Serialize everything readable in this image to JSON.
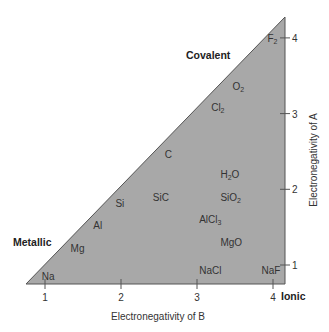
{
  "chart_data": {
    "type": "scatter",
    "title": "",
    "xlabel": "Electronegativity of B",
    "ylabel": "Electronegativity of A",
    "xlim": [
      0.75,
      4.15
    ],
    "ylim": [
      0.75,
      4.3
    ],
    "x_ticks": [
      "1",
      "2",
      "3",
      "4"
    ],
    "y_ticks": [
      "1",
      "2",
      "3",
      "4"
    ],
    "region_labels": {
      "covalent": "Covalent",
      "metallic": "Metallic",
      "ionic": "Ionic"
    },
    "fill_color": "#a8a8a8",
    "points": [
      {
        "label": "Na",
        "base": "Na",
        "sub": "",
        "x": 0.93,
        "y": 0.93
      },
      {
        "label": "Mg",
        "base": "Mg",
        "sub": "",
        "x": 1.31,
        "y": 1.31
      },
      {
        "label": "Al",
        "base": "Al",
        "sub": "",
        "x": 1.61,
        "y": 1.61
      },
      {
        "label": "Si",
        "base": "Si",
        "sub": "",
        "x": 1.9,
        "y": 1.9
      },
      {
        "label": "C",
        "base": "C",
        "sub": "",
        "x": 2.55,
        "y": 2.55
      },
      {
        "label": "Cl2",
        "base": "Cl",
        "sub": "2",
        "x": 3.16,
        "y": 3.16
      },
      {
        "label": "O2",
        "base": "O",
        "sub": "2",
        "x": 3.44,
        "y": 3.44
      },
      {
        "label": "F2",
        "base": "F",
        "sub": "2",
        "x": 3.98,
        "y": 3.98
      },
      {
        "label": "SiC",
        "base": "SiC",
        "sub": "",
        "x": 2.55,
        "y": 1.9
      },
      {
        "label": "H2O",
        "base": "H",
        "sub": "2",
        "tail": "O",
        "x": 3.44,
        "y": 2.2
      },
      {
        "label": "SiO2",
        "base": "SiO",
        "sub": "2",
        "x": 3.44,
        "y": 1.9
      },
      {
        "label": "AlCl3",
        "base": "AlCl",
        "sub": "3",
        "x": 3.16,
        "y": 1.61
      },
      {
        "label": "MgO",
        "base": "MgO",
        "sub": "",
        "x": 3.44,
        "y": 1.31
      },
      {
        "label": "NaCl",
        "base": "NaCl",
        "sub": "",
        "x": 3.16,
        "y": 0.93
      },
      {
        "label": "NaF",
        "base": "NaF",
        "sub": "",
        "x": 3.98,
        "y": 0.93
      }
    ]
  }
}
